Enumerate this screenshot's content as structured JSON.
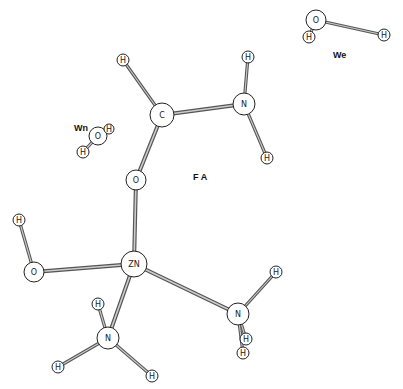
{
  "diagram": {
    "title": "",
    "colors": {
      "background": "#ffffff",
      "outline": "#222222",
      "bond_dark": "#555555",
      "bond_light": "#cccccc"
    },
    "group_labels": [
      {
        "id": "We",
        "text": "We",
        "x": 333,
        "y": 58
      },
      {
        "id": "Wn",
        "text": "Wn",
        "x": 74,
        "y": 131
      },
      {
        "id": "FA",
        "text": "F A",
        "x": 193,
        "y": 180
      }
    ],
    "atoms": [
      {
        "id": "We_O",
        "label": "O",
        "x": 316,
        "y": 20,
        "r": 10
      },
      {
        "id": "We_H1",
        "label": "H",
        "x": 309,
        "y": 37,
        "r": 6
      },
      {
        "id": "We_H2",
        "label": "H",
        "x": 384,
        "y": 35,
        "r": 6
      },
      {
        "id": "Wn_O",
        "label": "O",
        "x": 98,
        "y": 136,
        "r": 9
      },
      {
        "id": "Wn_H1",
        "label": "H",
        "x": 109,
        "y": 129,
        "r": 5
      },
      {
        "id": "Wn_H2",
        "label": "H",
        "x": 83,
        "y": 152,
        "r": 6
      },
      {
        "id": "C",
        "label": "C",
        "x": 162,
        "y": 115,
        "r": 12
      },
      {
        "id": "C_H",
        "label": "H",
        "x": 123,
        "y": 60,
        "r": 6
      },
      {
        "id": "N1",
        "label": "N",
        "x": 244,
        "y": 104,
        "r": 11
      },
      {
        "id": "N1_H1",
        "label": "H",
        "x": 248,
        "y": 57,
        "r": 6
      },
      {
        "id": "N1_H2",
        "label": "H",
        "x": 267,
        "y": 158,
        "r": 6
      },
      {
        "id": "O_FA",
        "label": "O",
        "x": 136,
        "y": 180,
        "r": 10
      },
      {
        "id": "ZN",
        "label": "ZN",
        "x": 134,
        "y": 264,
        "r": 13
      },
      {
        "id": "O_OH",
        "label": "O",
        "x": 34,
        "y": 272,
        "r": 10
      },
      {
        "id": "O_OH_H",
        "label": "H",
        "x": 19,
        "y": 220,
        "r": 6
      },
      {
        "id": "N2",
        "label": "N",
        "x": 108,
        "y": 338,
        "r": 11
      },
      {
        "id": "N2_H1",
        "label": "H",
        "x": 98,
        "y": 304,
        "r": 6
      },
      {
        "id": "N2_H2",
        "label": "H",
        "x": 58,
        "y": 367,
        "r": 6
      },
      {
        "id": "N2_H3",
        "label": "H",
        "x": 152,
        "y": 376,
        "r": 6
      },
      {
        "id": "N3",
        "label": "N",
        "x": 238,
        "y": 314,
        "r": 11
      },
      {
        "id": "N3_H1",
        "label": "H",
        "x": 276,
        "y": 272,
        "r": 6
      },
      {
        "id": "N3_H2",
        "label": "H",
        "x": 246,
        "y": 339,
        "r": 6
      },
      {
        "id": "N3_H3",
        "label": "H",
        "x": 243,
        "y": 353,
        "r": 6
      }
    ],
    "bonds": [
      [
        "We_O",
        "We_H1"
      ],
      [
        "We_O",
        "We_H2"
      ],
      [
        "Wn_O",
        "Wn_H1"
      ],
      [
        "Wn_O",
        "Wn_H2"
      ],
      [
        "C",
        "C_H"
      ],
      [
        "C",
        "N1"
      ],
      [
        "N1",
        "N1_H1"
      ],
      [
        "N1",
        "N1_H2"
      ],
      [
        "C",
        "O_FA"
      ],
      [
        "O_FA",
        "ZN"
      ],
      [
        "ZN",
        "O_OH"
      ],
      [
        "O_OH",
        "O_OH_H"
      ],
      [
        "ZN",
        "N2"
      ],
      [
        "N2",
        "N2_H1"
      ],
      [
        "N2",
        "N2_H2"
      ],
      [
        "N2",
        "N2_H3"
      ],
      [
        "ZN",
        "N3"
      ],
      [
        "N3",
        "N3_H1"
      ],
      [
        "N3",
        "N3_H2"
      ],
      [
        "N3",
        "N3_H3"
      ]
    ]
  }
}
